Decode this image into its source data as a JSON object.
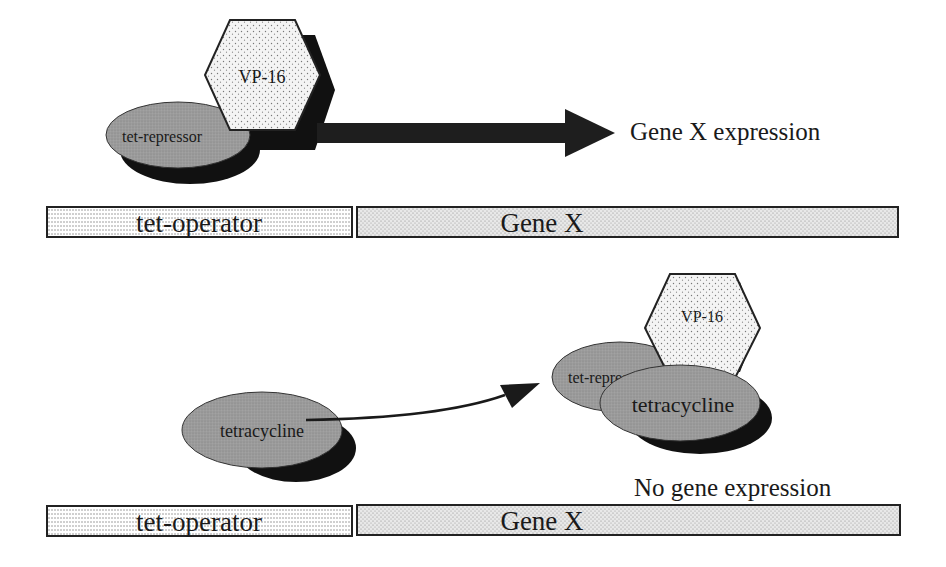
{
  "diagram": {
    "top_panel": {
      "activator_label": "VP-16",
      "repressor_label": "tet-repressor",
      "result_label": "Gene X expression",
      "operator_label": "tet-operator",
      "gene_label": "Gene X"
    },
    "bottom_panel": {
      "inducer_label": "tetracycline",
      "complex_activator_label": "VP-16",
      "complex_repressor_label": "tet-repressor",
      "complex_inducer_label": "tetracycline",
      "result_label": "No gene expression",
      "operator_label": "tet-operator",
      "gene_label": "Gene X"
    },
    "colors": {
      "ellipse_fill": "#9a9a9a",
      "shadow": "#111111",
      "hexagon_fill": "#eeeeee",
      "arrow": "#1e1e1e",
      "outline": "#222222"
    }
  }
}
